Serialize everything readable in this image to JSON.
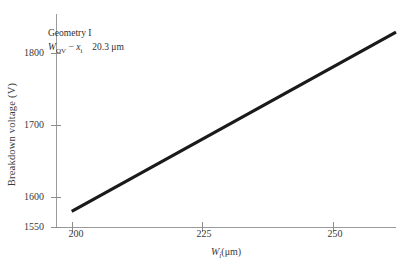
{
  "chart_data": {
    "type": "line",
    "title": "",
    "xlabel": "W_i(μm)",
    "ylabel": "Breakdown voltage (V)",
    "xlim": [
      197,
      262
    ],
    "ylim": [
      1550,
      1845
    ],
    "xticks": [
      200,
      225,
      250
    ],
    "xtick_labels": [
      "200",
      "225",
      "250"
    ],
    "yticks": [
      1550,
      1600,
      1700,
      1800
    ],
    "ytick_labels": [
      "1550",
      "1600",
      "1700",
      "1800"
    ],
    "grid": false,
    "legend": "none",
    "series": [
      {
        "name": "Geometry I",
        "x": [
          200,
          225,
          250,
          262
        ],
        "y": [
          1573,
          1673,
          1772,
          1820
        ],
        "color": "#1a1a1a",
        "linewidth": 3.2
      }
    ],
    "annotations": [
      {
        "line1": "Geometry I",
        "line2_symbol": "W",
        "line2_sub1": "OV",
        "line2_minus": "−",
        "line2_symbol2": "x",
        "line2_sub2": "i",
        "line2_value": "20.3 μm"
      }
    ]
  },
  "axes": {
    "ylabel": "Breakdown voltage (V)",
    "xlabel_main": "W",
    "xlabel_sub": "i",
    "xlabel_unit": "(μm)",
    "ytick_labels": [
      "1800",
      "1700",
      "1600",
      "1550"
    ],
    "xtick_labels": [
      "200",
      "225",
      "250"
    ]
  },
  "annotation": {
    "line1": "Geometry I",
    "w_symbol": "W",
    "w_sub": "OV",
    "minus": "−",
    "x_symbol": "x",
    "x_sub": "i",
    "value": "20.3 μm"
  },
  "colors": {
    "line": "#1a1a1a",
    "spine": "#9a9a9a",
    "text": "#2f2f2f",
    "background": "#ffffff"
  }
}
